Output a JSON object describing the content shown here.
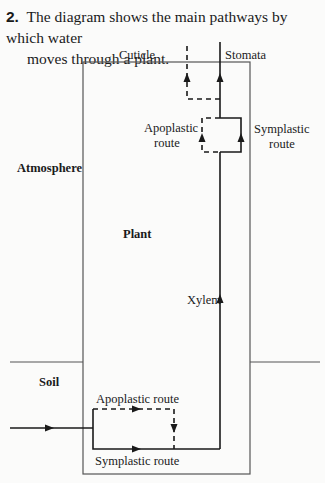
{
  "question": {
    "number": "2.",
    "text_line1": "The diagram shows the main pathways by which water",
    "text_line2": "moves through a plant."
  },
  "diagram": {
    "labels": {
      "cuticle": "Cuticle",
      "stomata": "Stomata",
      "atmosphere": "Atmosphere",
      "plant": "Plant",
      "xylem": "Xylem",
      "soil": "Soil",
      "upper_apoplastic_line1": "Apoplastic",
      "upper_apoplastic_line2": "route",
      "upper_symplastic_line1": "Symplastic",
      "upper_symplastic_line2": "route",
      "lower_apoplastic": "Apoplastic route",
      "lower_symplastic": "Symplastic route"
    },
    "legend": {
      "solid_line": "symplastic / xylem pathway",
      "dashed_line": "apoplastic pathway"
    },
    "colors": {
      "line": "#1a1a1a",
      "box": "#555555",
      "background": "#fbfbfa"
    }
  }
}
